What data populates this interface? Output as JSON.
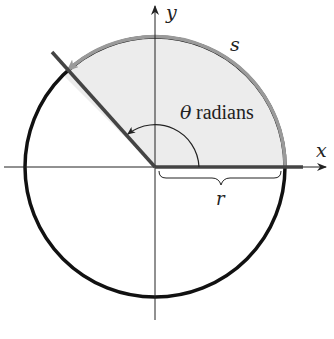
{
  "diagram": {
    "labels": {
      "x_axis": "x",
      "y_axis": "y",
      "arc": "s",
      "radius": "r",
      "angle_symbol": "θ",
      "angle_unit": "radians"
    },
    "geometry": {
      "center": [
        155,
        167
      ],
      "radius_px": 130,
      "theta_deg": 135
    },
    "colors": {
      "sector_fill": "#ececec",
      "arc_s": "#9a9a9a",
      "circle": "#111111",
      "ray": "#444444",
      "axis": "#222222"
    }
  }
}
